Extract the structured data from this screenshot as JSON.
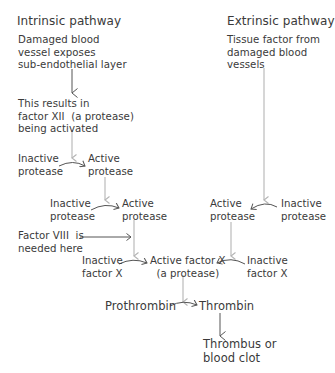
{
  "intrinsic": {
    "title": "Intrinsic pathway",
    "start": "Damaged blood\nvessel exposes\nsub-endothelial layer",
    "factor_xii": "This results in\nfactor XII  (a protease)\nbeing activated",
    "step1_inactive": "Inactive\nprotease",
    "step1_active": "Active\nprotease",
    "step2_inactive": "Inactive\nprotease",
    "step2_active": "Active\nprotease",
    "factor_viii": "Factor VIII  is\nneeded here",
    "inactive_factor_x": "Inactive\nfactor X"
  },
  "extrinsic": {
    "title": "Extrinsic pathway",
    "start": "Tissue factor from\ndamaged blood\nvessels",
    "active": "Active\nprotease",
    "inactive": "Inactive\nprotease",
    "inactive_factor_x": "Inactive\nfactor X"
  },
  "common": {
    "active_factor_x": "Active factor X\n(a protease)",
    "prothrombin": "Prothrombin",
    "thrombin": "Thrombin",
    "result": "Thrombus or\nblood clot"
  },
  "colors": {
    "text": "#3a3a3a",
    "vertical_arrow": "#b4b4b4",
    "curved_arrow": "#555555"
  }
}
